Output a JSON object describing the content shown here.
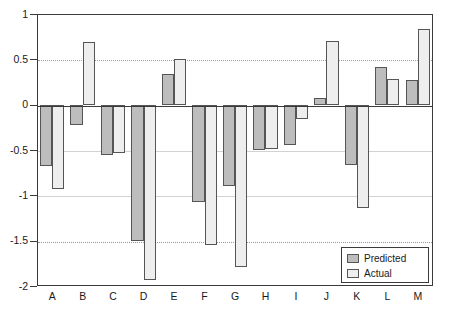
{
  "chart_data": {
    "type": "bar",
    "title": "",
    "xlabel": "",
    "ylabel": "",
    "ylim": [
      -2,
      1
    ],
    "grid": true,
    "legend_position": "bottom-right",
    "categories": [
      "A",
      "B",
      "C",
      "D",
      "E",
      "F",
      "G",
      "H",
      "I",
      "J",
      "K",
      "L",
      "M"
    ],
    "ytick_labels": [
      "1",
      "0.5",
      "0",
      "-0.5",
      "-1",
      "-1.5",
      "-2"
    ],
    "ytick_values": [
      1,
      0.5,
      0,
      -0.5,
      -1,
      -1.5,
      -2
    ],
    "series": [
      {
        "name": "Predicted",
        "color": "#bdbdbd",
        "values": [
          -0.68,
          -0.22,
          -0.55,
          -1.5,
          0.34,
          -1.07,
          -0.9,
          -0.5,
          -0.45,
          0.07,
          -0.67,
          0.41,
          0.27
        ]
      },
      {
        "name": "Actual",
        "color": "#eeeeee",
        "values": [
          -0.93,
          0.69,
          -0.53,
          -1.93,
          0.5,
          -1.55,
          -1.79,
          -0.49,
          -0.16,
          0.7,
          -1.14,
          0.28,
          0.83
        ]
      }
    ]
  },
  "legend": {
    "items": [
      {
        "label": "Predicted",
        "swatch": "predicted"
      },
      {
        "label": "Actual",
        "swatch": "actual"
      }
    ]
  }
}
